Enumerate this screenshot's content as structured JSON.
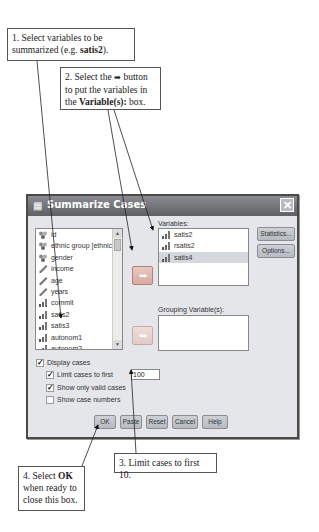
{
  "callouts": {
    "step1": {
      "text_pre": "1. Select variables to be summarized (e.g. ",
      "bold": "satis2",
      "text_post": ")."
    },
    "step2": {
      "text_pre": "2. Select the ",
      "arrow_glyph": "➡",
      "text_mid": " button to put the variables in the ",
      "bold": "Variable(s):",
      "text_post": " box."
    },
    "step3": {
      "text": "3. Limit cases to first 10."
    },
    "step4": {
      "text_pre": "4. Select ",
      "bold": "OK",
      "text_post": " when ready to close this box."
    }
  },
  "dialog": {
    "title": "Summarize Cases",
    "title_icon": "spss-dialog-icon",
    "close_icon": "close-icon",
    "source_list": {
      "items": [
        {
          "label": "id",
          "icon": "nominal-icon"
        },
        {
          "label": "ethnic group [ethnic...",
          "icon": "nominal-icon"
        },
        {
          "label": "gender",
          "icon": "nominal-icon"
        },
        {
          "label": "income",
          "icon": "scale-icon"
        },
        {
          "label": "age",
          "icon": "scale-icon"
        },
        {
          "label": "years",
          "icon": "scale-icon"
        },
        {
          "label": "commit",
          "icon": "ordinal-icon"
        },
        {
          "label": "satis2",
          "icon": "ordinal-icon"
        },
        {
          "label": "satis3",
          "icon": "ordinal-icon"
        },
        {
          "label": "autonom1",
          "icon": "ordinal-icon"
        },
        {
          "label": "autonom2",
          "icon": "ordinal-icon"
        }
      ]
    },
    "variables": {
      "label": "Variables:",
      "items": [
        {
          "label": "satis2",
          "icon": "ordinal-icon",
          "selected": false
        },
        {
          "label": "rsatis2",
          "icon": "ordinal-icon",
          "selected": false
        },
        {
          "label": "satis4",
          "icon": "ordinal-icon",
          "selected": true
        }
      ]
    },
    "grouping": {
      "label": "Grouping Variable(s):",
      "items": []
    },
    "side_buttons": {
      "statistics": "Statistics...",
      "options": "Options..."
    },
    "move_arrow_glyph": "➥",
    "options": {
      "display_cases": {
        "label": "Display cases",
        "checked": true
      },
      "limit_cases": {
        "label": "Limit cases to first",
        "checked": true,
        "value": "100"
      },
      "valid_only": {
        "label": "Show only valid cases",
        "checked": true
      },
      "case_numbers": {
        "label": "Show case numbers",
        "checked": false
      }
    },
    "bottom_buttons": {
      "ok": "OK",
      "paste": "Paste",
      "reset": "Reset",
      "cancel": "Cancel",
      "help": "Help"
    }
  }
}
